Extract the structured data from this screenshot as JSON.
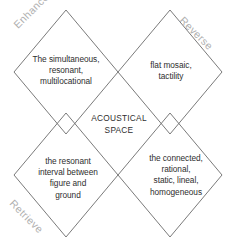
{
  "diagram": {
    "title": "ACOUSTICAL\nSPACE",
    "type": "mcluhan-tetrad",
    "line_color": "#6b6b6b",
    "label_color": "#b0b0b0",
    "text_color": "#2e2e2e",
    "background": "#ffffff",
    "corners": {
      "top_left": "Enhance",
      "top_right": "Reverse",
      "bottom_left": "Retrieve",
      "bottom_right": "Obsolesce"
    },
    "quadrants": {
      "top_left": "The simultaneous,\nresonant,\nmultilocational",
      "top_right": "flat mosaic,\ntactility",
      "bottom_left": "the resonant\ninterval between\nfigure and\nground",
      "bottom_right": "the connected,\nrational,\nstatic, lineal,\nhomogeneous"
    }
  }
}
